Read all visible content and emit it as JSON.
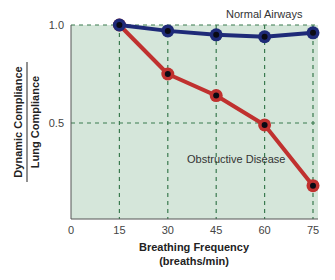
{
  "chart_data": {
    "type": "line",
    "title": "",
    "xlabel": "Breathing Frequency (breaths/min)",
    "xlabel_lines": [
      "Breathing Frequency",
      "(breaths/min)"
    ],
    "ylabel": "Dynamic Compliance / Lung Compliance",
    "ylabel_numerator": "Dynamic Compliance",
    "ylabel_denominator": "Lung Compliance",
    "x": [
      15,
      30,
      45,
      60,
      75
    ],
    "x_ticks": [
      "0",
      "15",
      "30",
      "45",
      "60",
      "75"
    ],
    "y_ticks": [
      "0.5",
      "1.0"
    ],
    "xlim": [
      0,
      75
    ],
    "ylim": [
      0,
      1.0
    ],
    "grid": "dashed",
    "series": [
      {
        "name": "Normal Airways",
        "color": "#1e2a78",
        "values": [
          1.0,
          0.97,
          0.95,
          0.94,
          0.96
        ]
      },
      {
        "name": "Obstructive Disease",
        "color": "#c0312f",
        "values": [
          1.0,
          0.75,
          0.64,
          0.49,
          0.18
        ]
      }
    ],
    "annotations": [
      {
        "text": "Normal Airways",
        "series": 0
      },
      {
        "text": "Obstructive Disease",
        "series": 1
      }
    ],
    "background": "#d5e6da",
    "grid_color": "#3a7a4f"
  }
}
